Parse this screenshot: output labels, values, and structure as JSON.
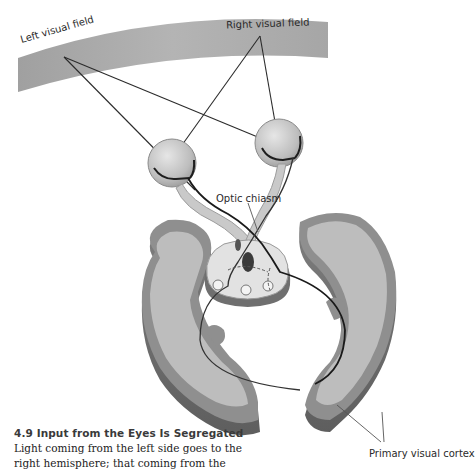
{
  "figure": {
    "labels": {
      "left_visual_field": "Left visual field",
      "right_visual_field": "Right visual field",
      "optic_chiasm": "Optic chiasm",
      "primary_visual_cortex": "Primary visual cortex"
    },
    "colors": {
      "visual_field_band": "#a9a9a9",
      "cortex_gray_matter": "#8f8f8f",
      "white_matter": "#bdbdbd",
      "eye_fill": "#c8c8c8",
      "pathway_line": "#1e1e1e",
      "pointer_line": "#555555"
    }
  },
  "caption": {
    "number": "4.9",
    "title": "4.9  Input from the Eyes Is Segregated",
    "body": "Light coming from the left side goes to the right hemisphere; that coming from the"
  }
}
